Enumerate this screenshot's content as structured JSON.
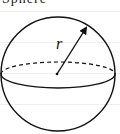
{
  "header": {
    "cut_off_text": "Sphere"
  },
  "diagram": {
    "type": "sphere",
    "radius_label": "r",
    "stroke_color": "#111111",
    "background_color": "#ffffff",
    "rule_color": "#eeeeee",
    "elements": [
      "outer-circle",
      "equator-ellipse-front-solid",
      "equator-ellipse-back-dashed",
      "center-point",
      "radius-arrow",
      "radius-label"
    ]
  }
}
